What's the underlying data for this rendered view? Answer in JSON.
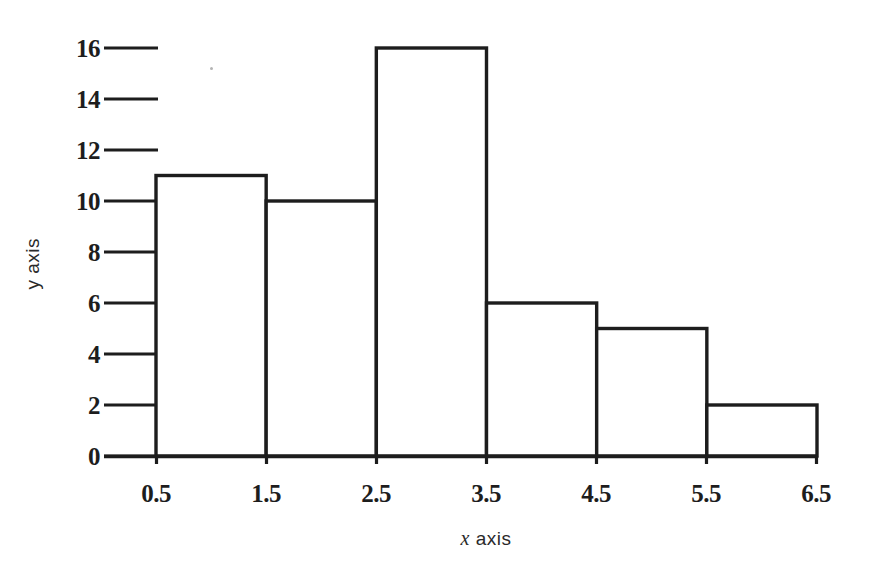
{
  "figure": {
    "background_color": "#ffffff",
    "ink_color": "#1d1d1d"
  },
  "chart_data": {
    "type": "bar",
    "title": "",
    "subtitle": "",
    "xlabel": "x axis",
    "xlabel_prefix": "x",
    "xlabel_suffix": "axis",
    "ylabel": "y axis",
    "categories": [
      "0.5-1.5",
      "1.5-2.5",
      "2.5-3.5",
      "3.5-4.5",
      "4.5-5.5",
      "5.5-6.5"
    ],
    "bin_edges": [
      0.5,
      1.5,
      2.5,
      3.5,
      4.5,
      5.5,
      6.5
    ],
    "values": [
      11,
      10,
      16,
      6,
      5,
      2
    ],
    "xtick_labels": [
      "0.5",
      "1.5",
      "2.5",
      "3.5",
      "4.5",
      "5.5",
      "6.5"
    ],
    "xtick_values": [
      0.5,
      1.5,
      2.5,
      3.5,
      4.5,
      5.5,
      6.5
    ],
    "ytick_labels": [
      "0",
      "2",
      "4",
      "6",
      "8",
      "10",
      "12",
      "14",
      "16"
    ],
    "ytick_values": [
      0,
      2,
      4,
      6,
      8,
      10,
      12,
      14,
      16
    ],
    "xlim": [
      0.5,
      6.5
    ],
    "ylim": [
      0,
      16
    ],
    "grid": false,
    "legend": null,
    "bar_fill": "#ffffff",
    "bar_stroke": "#1d1d1d",
    "annotations": []
  }
}
